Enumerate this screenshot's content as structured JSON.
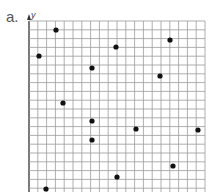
{
  "label": "a.",
  "chart_data": {
    "type": "scatter",
    "title": "",
    "xlabel": "",
    "ylabel": "y",
    "grid": true,
    "grid_columns": 20,
    "grid_rows_visible": 19.5,
    "cell_px": 8.8,
    "origin_px": [
      29,
      21
    ],
    "points_px": [
      [
        56,
        30
      ],
      [
        39,
        56
      ],
      [
        116,
        47
      ],
      [
        170,
        40
      ],
      [
        92,
        68
      ],
      [
        160,
        76
      ],
      [
        63,
        103
      ],
      [
        92,
        121
      ],
      [
        136,
        129
      ],
      [
        92,
        140
      ],
      [
        198,
        130
      ],
      [
        173,
        166
      ],
      [
        117,
        177
      ],
      [
        46,
        189
      ]
    ],
    "points_grid": [
      {
        "x": 3,
        "y": 1
      },
      {
        "x": 1,
        "y": 4
      },
      {
        "x": 10,
        "y": 3
      },
      {
        "x": 16,
        "y": 2
      },
      {
        "x": 7,
        "y": 5.3
      },
      {
        "x": 15,
        "y": 6.3
      },
      {
        "x": 4,
        "y": 9.3
      },
      {
        "x": 7,
        "y": 11.3
      },
      {
        "x": 12,
        "y": 12.3
      },
      {
        "x": 7,
        "y": 13.5
      },
      {
        "x": 19,
        "y": 12.4
      },
      {
        "x": 16.3,
        "y": 16.5
      },
      {
        "x": 10,
        "y": 17.7
      },
      {
        "x": 2,
        "y": 19
      }
    ],
    "point_color": "#111111",
    "grid_color": "#9a9a9a"
  }
}
